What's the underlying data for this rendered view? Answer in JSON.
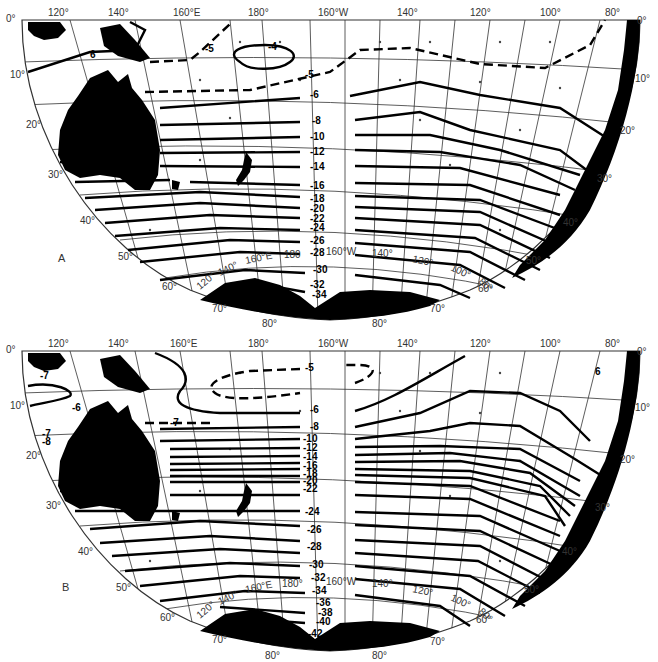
{
  "figure": {
    "panels": [
      {
        "id": "A",
        "label": "A",
        "top_longitude_labels": [
          "120°",
          "140°",
          "160°E",
          "180°",
          "160°W",
          "140°",
          "120°",
          "100°",
          "80°"
        ],
        "left_latitude_labels": [
          "0°",
          "10°",
          "20°",
          "30°",
          "40°",
          "50°",
          "60°",
          "70°"
        ],
        "right_latitude_labels": [
          "0°",
          "10°",
          "20°",
          "30°",
          "40°",
          "50°",
          "60°",
          "70°"
        ],
        "bottom_latitude_labels": [
          "80°",
          "80°"
        ],
        "inner_longitude_labels": [
          "120°",
          "140°",
          "160°E",
          "180",
          "160°W",
          "140°",
          "120°",
          "100°",
          "80°"
        ],
        "contour_labels": [
          "-4",
          "-5",
          "-5",
          "-6",
          "-6",
          "-8",
          "-10",
          "-12",
          "-14",
          "-16",
          "-18",
          "-20",
          "-22",
          "-24",
          "-26",
          "-28",
          "-30",
          "-32",
          "-34"
        ]
      },
      {
        "id": "B",
        "label": "B",
        "top_longitude_labels": [
          "120°",
          "140°",
          "160°E",
          "180°",
          "160°W",
          "140°",
          "120°",
          "100°",
          "80°"
        ],
        "left_latitude_labels": [
          "0°",
          "10°",
          "20°",
          "30°",
          "40°",
          "50°",
          "60°",
          "70°"
        ],
        "right_latitude_labels": [
          "0°",
          "10°",
          "20°",
          "30°",
          "40°",
          "50°",
          "60°",
          "70°"
        ],
        "bottom_latitude_labels": [
          "80°",
          "80°"
        ],
        "inner_longitude_labels": [
          "120°",
          "140°",
          "160°E",
          "180°",
          "160°W",
          "140°",
          "120°",
          "100°",
          "80°"
        ],
        "contour_labels": [
          "-5",
          "-6",
          "-6",
          "-6",
          "-7",
          "-7",
          "-7",
          "-8",
          "-8",
          "-10",
          "-12",
          "-14",
          "-16",
          "-18",
          "-20",
          "-22",
          "-24",
          "-26",
          "-28",
          "-30",
          "-32",
          "-34",
          "-36",
          "-38",
          "-40",
          "-42"
        ]
      }
    ]
  },
  "a": {
    "label": "A",
    "lon": [
      "120°",
      "140°",
      "160°E",
      "180°",
      "160°W",
      "140°",
      "120°",
      "100°",
      "80°"
    ],
    "lat_left": [
      "0°",
      "10°",
      "20°",
      "30°",
      "40°",
      "50°",
      "60°",
      "70°"
    ],
    "lat_right": [
      "0°",
      "10°",
      "20°",
      "30°",
      "40°",
      "50°",
      "60°",
      "70°"
    ],
    "lat_bottom": [
      "80°",
      "80°"
    ],
    "inner_lon": [
      "120°",
      "140°",
      "160°E",
      "180",
      "160°W",
      "140°",
      "120°",
      "100°",
      "80°"
    ],
    "c": {
      "m4": "-4",
      "m5a": "-5",
      "m5b": "-5",
      "m6a": "6",
      "m6b": "-6",
      "m8": "-8",
      "m10": "-10",
      "m12": "-12",
      "m14": "-14",
      "m16": "-16",
      "m18": "-18",
      "m20": "-20",
      "m22": "-22",
      "m24": "-24",
      "m26": "-26",
      "m28": "-28",
      "m30": "-30",
      "m32": "-32",
      "m34": "-34"
    }
  },
  "b": {
    "label": "B",
    "lon": [
      "120°",
      "140°",
      "160°E",
      "180°",
      "160°W",
      "140°",
      "120°",
      "100°",
      "80°"
    ],
    "lat_left": [
      "0°",
      "10°",
      "20°",
      "30°",
      "40°",
      "50°",
      "60°",
      "70°"
    ],
    "lat_right": [
      "0°",
      "10°",
      "20°",
      "30°",
      "40°",
      "50°",
      "60°",
      "70°"
    ],
    "lat_bottom": [
      "80°",
      "80°"
    ],
    "inner_lon": [
      "120°",
      "140°",
      "160°E",
      "180°",
      "160°W",
      "140°",
      "120°",
      "100°",
      "80°"
    ],
    "c": {
      "m5": "-5",
      "m6a": "-6",
      "m6b": "-6",
      "m6c": "6",
      "m7a": "-7",
      "m7b": "-7",
      "m7c": "-7",
      "m8a": "-8",
      "m8b": "-8",
      "m10": "-10",
      "m12": "-12",
      "m14": "-14",
      "m16": "-16",
      "m18": "-18",
      "m20": "-20",
      "m22": "-22",
      "m24": "-24",
      "m26": "-26",
      "m28": "-28",
      "m30": "-30",
      "m32": "-32",
      "m34": "-34",
      "m36": "-36",
      "m38": "-38",
      "m40": "-40",
      "m42": "-42"
    }
  }
}
